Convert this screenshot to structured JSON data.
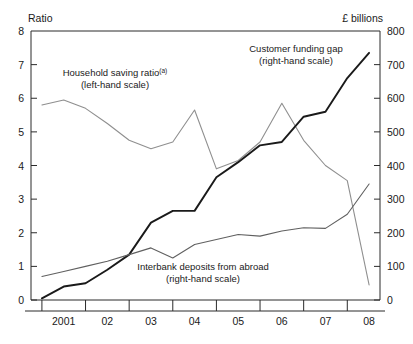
{
  "chart_data": {
    "type": "line",
    "title": "",
    "xlabel": "",
    "left_axis": {
      "label": "Ratio",
      "ylim": [
        0,
        8
      ],
      "ticks": [
        0,
        1,
        2,
        3,
        4,
        5,
        6,
        7,
        8
      ],
      "tick_labels": [
        "0",
        "1",
        "2",
        "3",
        "4",
        "5",
        "6",
        "7",
        "8"
      ]
    },
    "right_axis": {
      "label": "£ billions",
      "ylim": [
        0,
        800
      ],
      "ticks": [
        0,
        100,
        200,
        300,
        400,
        500,
        600,
        700,
        800
      ],
      "tick_labels": [
        "0",
        "100",
        "200",
        "300",
        "400",
        "500",
        "600",
        "700",
        "800"
      ]
    },
    "x_tick_labels": [
      "2001",
      "02",
      "03",
      "04",
      "05",
      "06",
      "07",
      "08"
    ],
    "x": [
      2000.5,
      2001.0,
      2001.5,
      2002.0,
      2002.5,
      2003.0,
      2003.5,
      2004.0,
      2004.5,
      2005.0,
      2005.5,
      2006.0,
      2006.5,
      2007.0,
      2007.5,
      2008.0
    ],
    "xlim": [
      2000.25,
      2008.25
    ],
    "grid": false,
    "legend_position": "inline-annotations",
    "series": [
      {
        "name": "Household saving ratio",
        "axis": "left",
        "color": "#8f8f8f",
        "values": [
          5.8,
          5.95,
          5.7,
          5.25,
          4.75,
          4.5,
          4.7,
          5.65,
          3.9,
          4.15,
          4.7,
          5.85,
          4.75,
          4.0,
          3.55,
          0.45
        ]
      },
      {
        "name": "Customer funding gap",
        "axis": "right",
        "color": "#1a1a1a",
        "values": [
          5,
          40,
          50,
          90,
          135,
          230,
          265,
          265,
          365,
          410,
          460,
          470,
          545,
          560,
          660,
          735
        ]
      },
      {
        "name": "Interbank deposits from abroad",
        "axis": "right",
        "color": "#606060",
        "values": [
          70,
          85,
          100,
          115,
          135,
          155,
          125,
          165,
          180,
          195,
          190,
          205,
          215,
          213,
          255,
          345
        ]
      }
    ],
    "annotations": [
      {
        "name": "household-saving-ratio-annotation",
        "line1": "Household saving ratio",
        "superscript": "(a)",
        "line2": "(left-hand scale)"
      },
      {
        "name": "customer-funding-gap-annotation",
        "line1": "Customer funding gap",
        "line2": "(right-hand scale)"
      },
      {
        "name": "interbank-deposits-annotation",
        "line1": "Interbank deposits from abroad",
        "line2": "(right-hand scale)"
      }
    ]
  }
}
